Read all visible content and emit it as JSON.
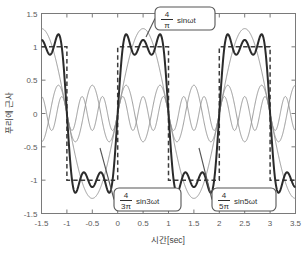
{
  "chart_data": {
    "type": "line",
    "title": "",
    "xlabel": "시간[sec]",
    "ylabel": "푸리에 근사",
    "xlim": [
      -1.5,
      3.5
    ],
    "ylim": [
      -1.5,
      1.5
    ],
    "xticks": [
      "-1.5",
      "-1",
      "-0.5",
      "0",
      "0.5",
      "1",
      "1.5",
      "2",
      "2.5",
      "3",
      "3.5"
    ],
    "xtick_values": [
      -1.5,
      -1,
      -0.5,
      0,
      0.5,
      1,
      1.5,
      2,
      2.5,
      3,
      3.5
    ],
    "yticks": [
      "1.5",
      "1",
      "0.5",
      "0",
      "-0.5",
      "-1",
      "-1.5"
    ],
    "ytick_values": [
      1.5,
      1,
      0.5,
      0,
      -0.5,
      -1,
      -1.5
    ],
    "grid": false,
    "legend": "none",
    "omega": 3.14159265,
    "period_sec": 2,
    "series": [
      {
        "name": "square-wave",
        "label": "square wave (target)",
        "style": "dashed",
        "color": "#3c3c3c",
        "amplitude": 1,
        "description": "Ideal square wave, +1 on (0,1), -1 on (1,2), period 2 s"
      },
      {
        "name": "fundamental",
        "label": "4/π sinωt",
        "style": "thin",
        "color": "#8d8d8d",
        "amplitude": 1.2732,
        "harmonic": 1
      },
      {
        "name": "third-harmonic",
        "label": "4/3π sin3ωt",
        "style": "thin",
        "color": "#8d8d8d",
        "amplitude": 0.4244,
        "harmonic": 3
      },
      {
        "name": "fifth-harmonic",
        "label": "4/5π sin5ωt",
        "style": "thin",
        "color": "#8d8d8d",
        "amplitude": 0.2546,
        "harmonic": 5
      },
      {
        "name": "fourier-sum",
        "label": "sum of first three harmonics",
        "style": "thick",
        "color": "#2b2b2b",
        "harmonics": [
          1,
          3,
          5
        ],
        "amplitudes": [
          1.2732,
          0.4244,
          0.2546
        ]
      }
    ],
    "annotations": [
      {
        "name": "fundamental",
        "numerator": "4",
        "denominator": "π",
        "trail": "sinωt",
        "box_x": 155,
        "box_y": 7,
        "box_w": 60,
        "box_h": 23,
        "leader_to_x": 146,
        "leader_to_y": 37
      },
      {
        "name": "third-harmonic",
        "numerator": "4",
        "denominator": "3π",
        "trail": "sin3ωt",
        "box_x": 114,
        "box_y": 188,
        "box_w": 67,
        "box_h": 23,
        "leader_to_x": 100,
        "leader_to_y": 148
      },
      {
        "name": "fifth-harmonic",
        "numerator": "4",
        "denominator": "5π",
        "trail": "sin5ωt",
        "box_x": 212,
        "box_y": 188,
        "box_w": 64,
        "box_h": 23,
        "leader_to_x": 199,
        "leader_to_y": 148
      }
    ]
  },
  "axes": {
    "x_title": "시간[sec]",
    "y_title": "푸리에 근사"
  },
  "colors": {
    "background": "#ffffff",
    "axis": "#7a7a7a",
    "harmonic": "#8d8d8d",
    "sum": "#2b2b2b",
    "square": "#3c3c3c",
    "text": "#4a4a4a"
  }
}
